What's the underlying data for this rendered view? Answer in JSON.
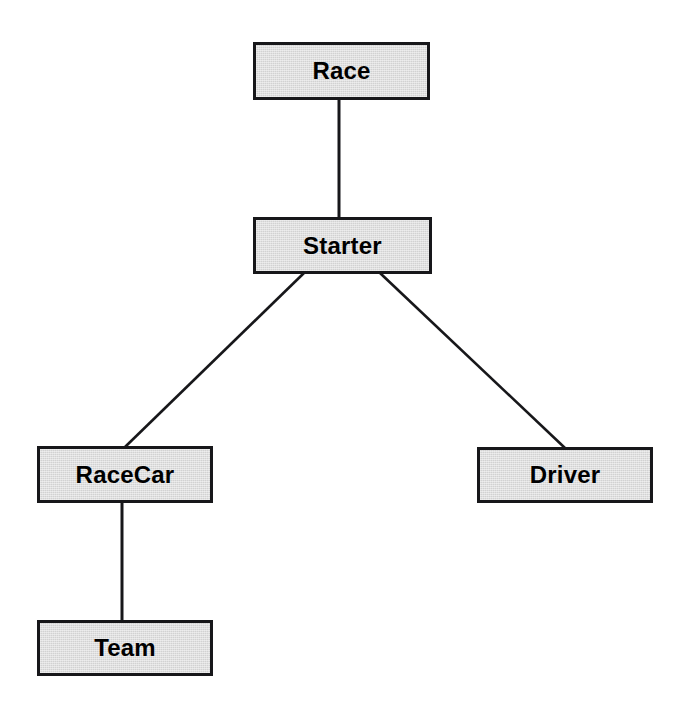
{
  "diagram": {
    "type": "node-link-tree",
    "background_color": "#ffffff",
    "node_fill_color": "#d2d2d2",
    "node_border_color": "#17171a",
    "edge_color": "#17171a",
    "label_color": "#000000",
    "nodes": [
      {
        "id": "race",
        "label": "Race",
        "x": 253,
        "y": 42,
        "width": 177,
        "height": 58
      },
      {
        "id": "starter",
        "label": "Starter",
        "x": 253,
        "y": 217,
        "width": 179,
        "height": 57
      },
      {
        "id": "racecar",
        "label": "RaceCar",
        "x": 37,
        "y": 446,
        "width": 176,
        "height": 57
      },
      {
        "id": "driver",
        "label": "Driver",
        "x": 477,
        "y": 447,
        "width": 176,
        "height": 56
      },
      {
        "id": "team",
        "label": "Team",
        "x": 37,
        "y": 620,
        "width": 176,
        "height": 56
      }
    ],
    "edges": [
      {
        "id": "race-starter",
        "from": "race",
        "to": "starter",
        "x1": 339,
        "y1": 100,
        "x2": 339,
        "y2": 219,
        "style": "vertical"
      },
      {
        "id": "starter-racecar",
        "from": "starter",
        "to": "racecar",
        "x1": 304,
        "y1": 273,
        "x2": 125,
        "y2": 447,
        "style": "diagonal"
      },
      {
        "id": "starter-driver",
        "from": "starter",
        "to": "driver",
        "x1": 380,
        "y1": 273,
        "x2": 565,
        "y2": 448,
        "style": "diagonal"
      },
      {
        "id": "racecar-team",
        "from": "racecar",
        "to": "team",
        "x1": 122,
        "y1": 502,
        "x2": 122,
        "y2": 621,
        "style": "vertical"
      }
    ]
  }
}
